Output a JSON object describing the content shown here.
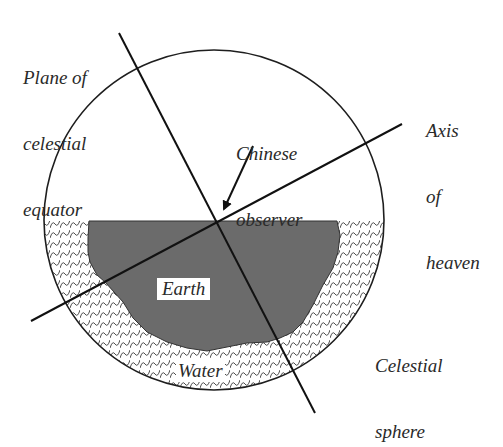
{
  "diagram": {
    "colors": {
      "background": "#ffffff",
      "ink": "#1e1e1e",
      "earth_fill": "#6b6b6b",
      "water_pattern": "#333333"
    },
    "labels": {
      "plane_of_equator": [
        "Plane of",
        "celestial",
        "equator"
      ],
      "axis_of_heaven": [
        "Axis",
        "of",
        "heaven"
      ],
      "chinese_observer": [
        "Chinese",
        "observer"
      ],
      "earth": "Earth",
      "water": "Water",
      "celestial_sphere": [
        "Celestial",
        "sphere"
      ]
    },
    "elements": {
      "celestial_sphere": {
        "cx": 214,
        "cy": 220,
        "r": 170
      },
      "water_level_y": 221,
      "plane_line": {
        "x1": 119,
        "y1": 33,
        "x2": 315,
        "y2": 413
      },
      "axis_line": {
        "x1": 402,
        "y1": 124,
        "x2": 31,
        "y2": 321
      },
      "observer_arrow": {
        "x1": 253,
        "y1": 146,
        "x2": 222,
        "y2": 213
      }
    }
  }
}
